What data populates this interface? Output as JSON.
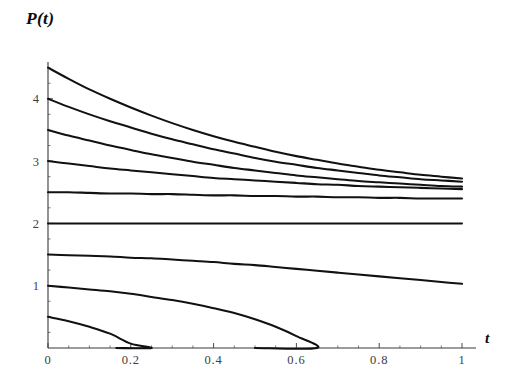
{
  "figure": {
    "title": "P(t)",
    "background_color": "#ffffff",
    "curve_color": "#111111",
    "axis_color": "#3a3a3a",
    "tick_label_color": "#3d3d3d",
    "width": 509,
    "height": 383
  },
  "axes": {
    "x_name": "t",
    "y_name": "P(t)",
    "x_tick_labels": [
      "0",
      "0.2",
      "0.4",
      "0.6",
      "0.8",
      "1"
    ],
    "y_tick_labels": [
      "1",
      "2",
      "3",
      "4"
    ]
  },
  "chart_data": {
    "type": "line",
    "title": "P(t)",
    "xlabel": "t",
    "ylabel": "P(t)",
    "xlim": [
      0,
      1
    ],
    "ylim": [
      0,
      4.6
    ],
    "xticks": [
      0,
      0.2,
      0.4,
      0.6,
      0.8,
      1
    ],
    "xticklabels": [
      "0",
      "0.2",
      "0.4",
      "0.6",
      "0.8",
      "1"
    ],
    "yticks": [
      1,
      2,
      3,
      4
    ],
    "yticklabels": [
      "1",
      "2",
      "3",
      "4"
    ],
    "x_minor_tick_step": 0.05,
    "y_minor_tick_step": 0.25,
    "grid": false,
    "legend": false,
    "legend_position": "none",
    "annotations": [],
    "x": [
      0,
      0.05,
      0.1,
      0.15,
      0.2,
      0.25,
      0.3,
      0.35,
      0.4,
      0.45,
      0.5,
      0.55,
      0.6,
      0.65,
      0.7,
      0.75,
      0.8,
      0.85,
      0.9,
      0.95,
      1
    ],
    "series": [
      {
        "name": "P(0) = 4.5",
        "initial_value": 4.5,
        "values": [
          4.5,
          4.32,
          4.15,
          4.0,
          3.86,
          3.73,
          3.61,
          3.5,
          3.4,
          3.31,
          3.23,
          3.15,
          3.08,
          3.02,
          2.96,
          2.91,
          2.86,
          2.82,
          2.78,
          2.75,
          2.72
        ]
      },
      {
        "name": "P(0) = 4.0",
        "initial_value": 4.0,
        "values": [
          4.0,
          3.87,
          3.75,
          3.64,
          3.54,
          3.44,
          3.35,
          3.27,
          3.19,
          3.12,
          3.05,
          2.99,
          2.94,
          2.89,
          2.85,
          2.81,
          2.77,
          2.74,
          2.71,
          2.69,
          2.67
        ]
      },
      {
        "name": "P(0) = 3.5",
        "initial_value": 3.5,
        "values": [
          3.5,
          3.41,
          3.33,
          3.25,
          3.18,
          3.11,
          3.05,
          2.99,
          2.94,
          2.89,
          2.85,
          2.81,
          2.77,
          2.74,
          2.71,
          2.68,
          2.66,
          2.64,
          2.62,
          2.6,
          2.59
        ]
      },
      {
        "name": "P(0) = 3.0",
        "initial_value": 3.0,
        "values": [
          3.0,
          2.96,
          2.92,
          2.88,
          2.85,
          2.82,
          2.79,
          2.76,
          2.73,
          2.71,
          2.69,
          2.67,
          2.65,
          2.63,
          2.62,
          2.6,
          2.59,
          2.58,
          2.57,
          2.56,
          2.55
        ]
      },
      {
        "name": "P(0) = 2.5",
        "initial_value": 2.5,
        "values": [
          2.5,
          2.5,
          2.49,
          2.48,
          2.48,
          2.47,
          2.47,
          2.46,
          2.45,
          2.45,
          2.44,
          2.44,
          2.43,
          2.43,
          2.42,
          2.42,
          2.41,
          2.41,
          2.4,
          2.4,
          2.4
        ]
      },
      {
        "name": "P(0) = 2.0 (equilibrium)",
        "initial_value": 2.0,
        "values": [
          2.0,
          2.0,
          2.0,
          2.0,
          2.0,
          2.0,
          2.0,
          2.0,
          2.0,
          2.0,
          2.0,
          2.0,
          2.0,
          2.0,
          2.0,
          2.0,
          2.0,
          2.0,
          2.0,
          2.0,
          2.0
        ]
      },
      {
        "name": "P(0) = 1.5",
        "initial_value": 1.5,
        "values": [
          1.5,
          1.49,
          1.48,
          1.47,
          1.45,
          1.44,
          1.42,
          1.4,
          1.38,
          1.35,
          1.33,
          1.3,
          1.27,
          1.24,
          1.21,
          1.18,
          1.15,
          1.12,
          1.09,
          1.06,
          1.03
        ]
      },
      {
        "name": "P(0) = 1.0",
        "initial_value": 1.0,
        "values": [
          1.0,
          0.97,
          0.94,
          0.91,
          0.87,
          0.82,
          0.77,
          0.71,
          0.64,
          0.56,
          0.46,
          0.34,
          0.19,
          0.0,
          null,
          null,
          null,
          null,
          null,
          null,
          null
        ],
        "zero_crossing_t": 0.5
      },
      {
        "name": "P(0) = 0.5",
        "initial_value": 0.5,
        "values": [
          0.5,
          0.43,
          0.34,
          0.23,
          0.07,
          0.0,
          null,
          null,
          null,
          null,
          null,
          null,
          null,
          null,
          null,
          null,
          null,
          null,
          null,
          null,
          null
        ],
        "zero_crossing_t": 0.165
      }
    ]
  }
}
